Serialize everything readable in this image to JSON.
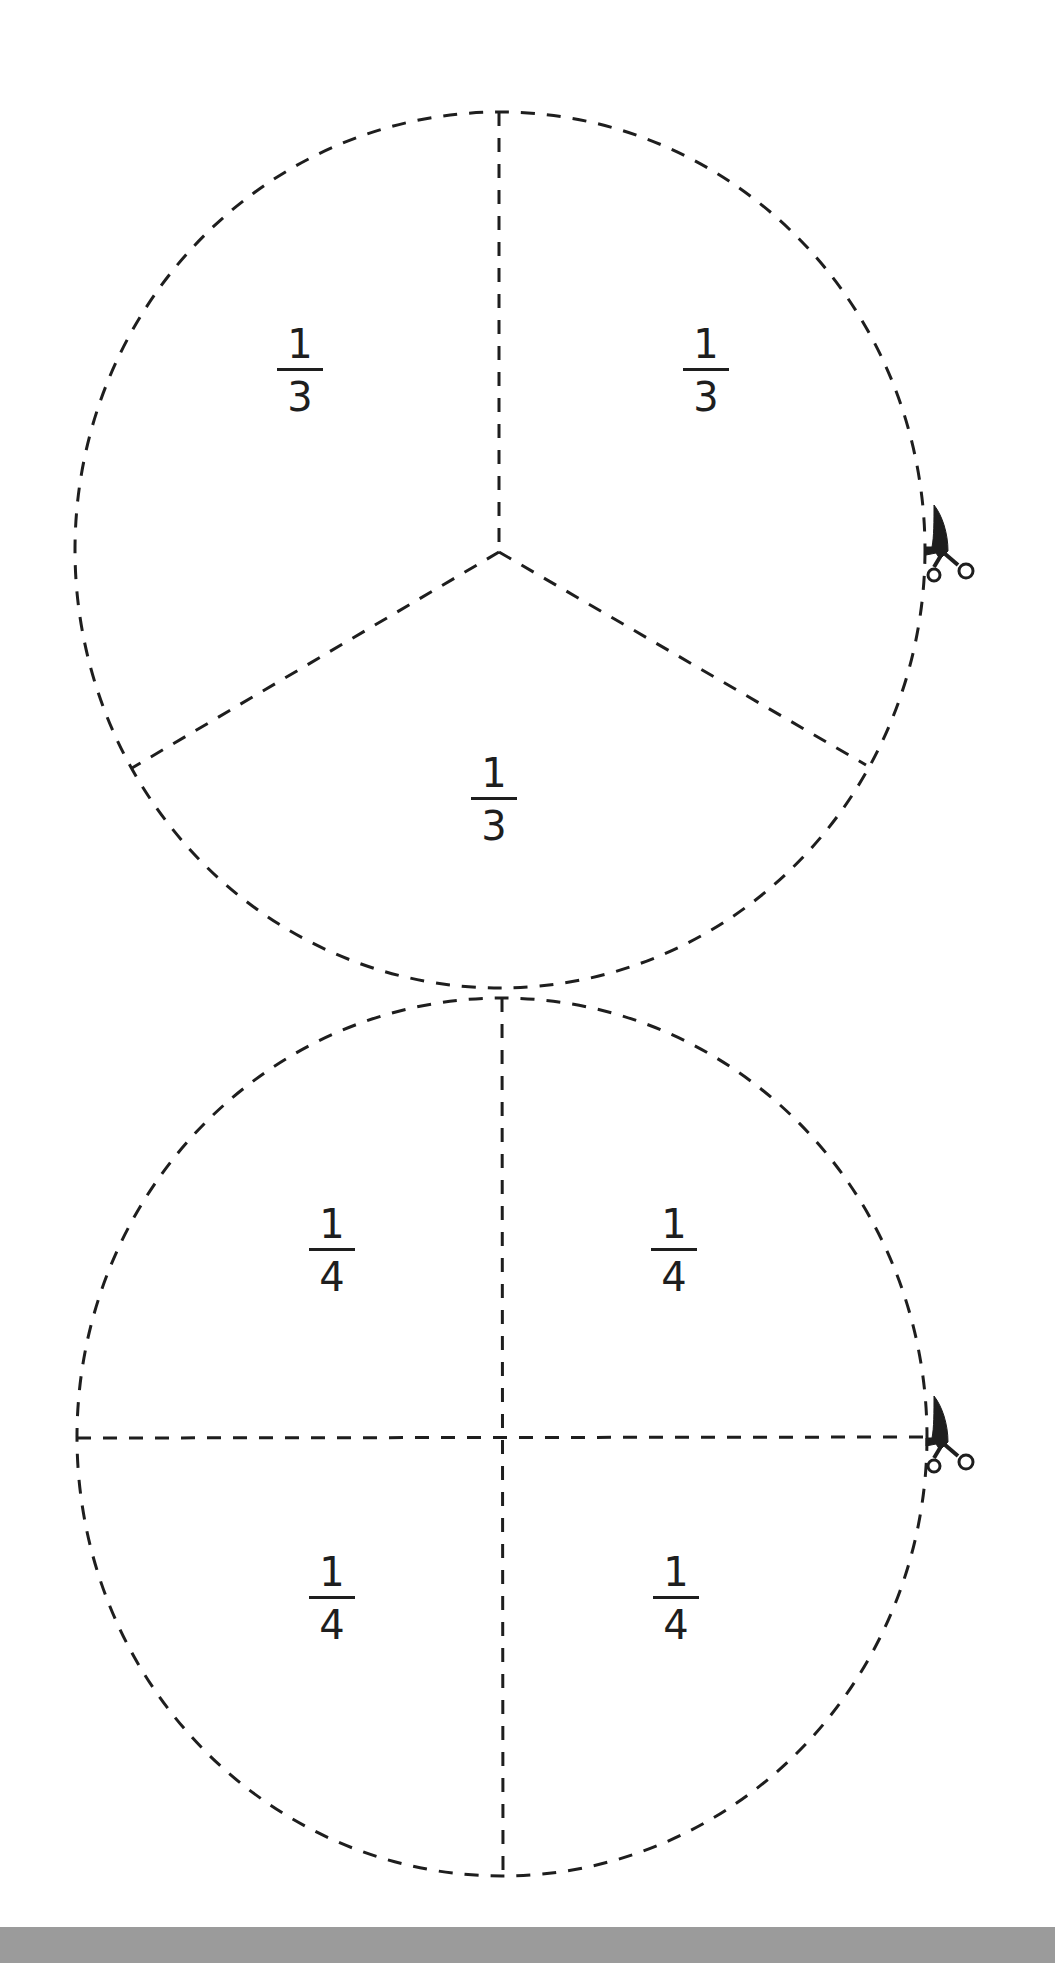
{
  "page": {
    "background": "#ffffff",
    "bottom_band_color": "#9b9b9b",
    "line_color": "#1e1e1e",
    "line_style": "dashed"
  },
  "circles": [
    {
      "name": "thirds-circle",
      "division": "thirds",
      "cut_icon": "scissors-icon",
      "pieces": [
        {
          "numerator": "1",
          "denominator": "3",
          "position": "top-left"
        },
        {
          "numerator": "1",
          "denominator": "3",
          "position": "top-right"
        },
        {
          "numerator": "1",
          "denominator": "3",
          "position": "bottom"
        }
      ]
    },
    {
      "name": "quarters-circle",
      "division": "quarters",
      "cut_icon": "scissors-icon",
      "pieces": [
        {
          "numerator": "1",
          "denominator": "4",
          "position": "top-left"
        },
        {
          "numerator": "1",
          "denominator": "4",
          "position": "top-right"
        },
        {
          "numerator": "1",
          "denominator": "4",
          "position": "bottom-left"
        },
        {
          "numerator": "1",
          "denominator": "4",
          "position": "bottom-right"
        }
      ]
    }
  ]
}
